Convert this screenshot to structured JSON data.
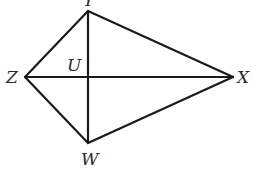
{
  "diagram": {
    "type": "kite",
    "vertices": {
      "Y": {
        "label": "Y",
        "x": 88,
        "y": 11
      },
      "Z": {
        "label": "Z",
        "x": 25,
        "y": 77
      },
      "X": {
        "label": "X",
        "x": 233,
        "y": 77
      },
      "W": {
        "label": "W",
        "x": 88,
        "y": 143
      }
    },
    "intersection": {
      "label": "U",
      "x": 88,
      "y": 77
    },
    "sides": [
      [
        "Y",
        "X"
      ],
      [
        "X",
        "W"
      ],
      [
        "W",
        "Z"
      ],
      [
        "Z",
        "Y"
      ]
    ],
    "diagonals": [
      [
        "Y",
        "W"
      ],
      [
        "Z",
        "X"
      ]
    ],
    "labels": {
      "top": "Y",
      "left": "Z",
      "right": "X",
      "bottom": "W",
      "center": "U"
    },
    "stroke_color": "#1a1a1a",
    "background": "#ffffff"
  }
}
